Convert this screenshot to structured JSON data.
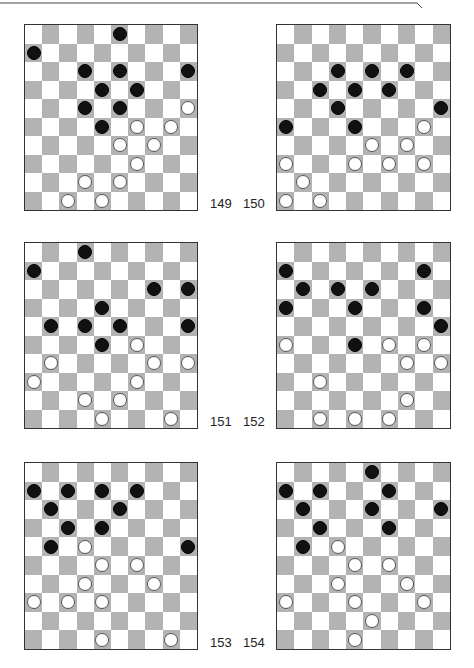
{
  "page": {
    "colors": {
      "dark_square": "#b3b3b3",
      "light_square": "#ffffff",
      "black_piece": "#111111",
      "white_piece": "#ffffff",
      "border": "#333333"
    }
  },
  "boards": [
    {
      "number": "149",
      "black": [
        [
          0,
          5
        ],
        [
          1,
          0
        ],
        [
          2,
          3
        ],
        [
          2,
          5
        ],
        [
          2,
          9
        ],
        [
          3,
          4
        ],
        [
          3,
          6
        ],
        [
          4,
          3
        ],
        [
          4,
          5
        ],
        [
          5,
          4
        ]
      ],
      "white": [
        [
          4,
          9
        ],
        [
          5,
          6
        ],
        [
          5,
          8
        ],
        [
          6,
          5
        ],
        [
          6,
          7
        ],
        [
          7,
          6
        ],
        [
          8,
          3
        ],
        [
          8,
          5
        ],
        [
          9,
          2
        ],
        [
          9,
          4
        ]
      ]
    },
    {
      "number": "150",
      "black": [
        [
          2,
          3
        ],
        [
          2,
          5
        ],
        [
          2,
          7
        ],
        [
          3,
          2
        ],
        [
          3,
          4
        ],
        [
          3,
          6
        ],
        [
          4,
          3
        ],
        [
          4,
          9
        ],
        [
          5,
          0
        ],
        [
          5,
          4
        ]
      ],
      "white": [
        [
          5,
          8
        ],
        [
          6,
          5
        ],
        [
          6,
          7
        ],
        [
          7,
          0
        ],
        [
          7,
          4
        ],
        [
          7,
          6
        ],
        [
          7,
          8
        ],
        [
          8,
          1
        ],
        [
          9,
          0
        ],
        [
          9,
          2
        ]
      ]
    },
    {
      "number": "151",
      "black": [
        [
          0,
          3
        ],
        [
          1,
          0
        ],
        [
          2,
          7
        ],
        [
          2,
          9
        ],
        [
          3,
          4
        ],
        [
          4,
          1
        ],
        [
          4,
          3
        ],
        [
          4,
          5
        ],
        [
          4,
          9
        ],
        [
          5,
          4
        ]
      ],
      "white": [
        [
          5,
          6
        ],
        [
          6,
          1
        ],
        [
          6,
          7
        ],
        [
          6,
          9
        ],
        [
          7,
          0
        ],
        [
          7,
          6
        ],
        [
          8,
          3
        ],
        [
          8,
          5
        ],
        [
          9,
          4
        ],
        [
          9,
          8
        ]
      ]
    },
    {
      "number": "152",
      "black": [
        [
          1,
          0
        ],
        [
          1,
          8
        ],
        [
          2,
          1
        ],
        [
          2,
          3
        ],
        [
          2,
          5
        ],
        [
          3,
          0
        ],
        [
          3,
          4
        ],
        [
          3,
          8
        ],
        [
          4,
          9
        ],
        [
          5,
          4
        ]
      ],
      "white": [
        [
          5,
          0
        ],
        [
          5,
          6
        ],
        [
          5,
          8
        ],
        [
          6,
          7
        ],
        [
          6,
          9
        ],
        [
          7,
          2
        ],
        [
          8,
          7
        ],
        [
          9,
          2
        ],
        [
          9,
          4
        ],
        [
          9,
          6
        ]
      ]
    },
    {
      "number": "153",
      "black": [
        [
          1,
          0
        ],
        [
          1,
          2
        ],
        [
          1,
          4
        ],
        [
          1,
          6
        ],
        [
          2,
          1
        ],
        [
          2,
          5
        ],
        [
          3,
          2
        ],
        [
          3,
          4
        ],
        [
          4,
          1
        ],
        [
          4,
          9
        ]
      ],
      "white": [
        [
          4,
          3
        ],
        [
          5,
          4
        ],
        [
          5,
          6
        ],
        [
          6,
          3
        ],
        [
          6,
          7
        ],
        [
          7,
          0
        ],
        [
          7,
          2
        ],
        [
          7,
          4
        ],
        [
          9,
          4
        ],
        [
          9,
          8
        ]
      ]
    },
    {
      "number": "154",
      "black": [
        [
          0,
          5
        ],
        [
          1,
          0
        ],
        [
          1,
          2
        ],
        [
          1,
          6
        ],
        [
          2,
          1
        ],
        [
          2,
          5
        ],
        [
          2,
          9
        ],
        [
          3,
          2
        ],
        [
          3,
          6
        ],
        [
          4,
          1
        ]
      ],
      "white": [
        [
          4,
          3
        ],
        [
          5,
          4
        ],
        [
          5,
          6
        ],
        [
          6,
          3
        ],
        [
          6,
          7
        ],
        [
          7,
          0
        ],
        [
          7,
          4
        ],
        [
          7,
          8
        ],
        [
          8,
          5
        ],
        [
          9,
          4
        ]
      ]
    }
  ]
}
